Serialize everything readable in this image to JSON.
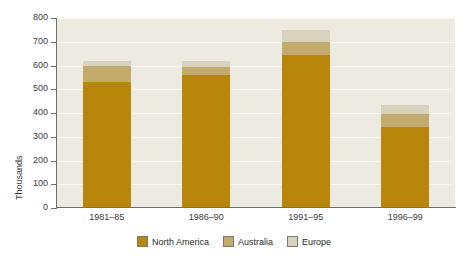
{
  "chart_data": {
    "type": "bar",
    "subtype": "stacked-vertical",
    "title": "",
    "xlabel": "",
    "ylabel": "Thousands",
    "ylim": [
      0,
      800
    ],
    "ytick_step": 100,
    "yticks": [
      0,
      100,
      200,
      300,
      400,
      500,
      600,
      700,
      800
    ],
    "ytick_labels": [
      "0",
      "100",
      "200",
      "300",
      "400",
      "500",
      "600",
      "700",
      "800"
    ],
    "categories": [
      "1981–85",
      "1986–90",
      "1991–95",
      "1996–99"
    ],
    "grid": true,
    "grid_axis": "y",
    "legend_position": "bottom-center",
    "series": [
      {
        "name": "North America",
        "color": "#b8860b",
        "values": [
          530,
          560,
          645,
          340
        ]
      },
      {
        "name": "Australia",
        "color": "#c3ab6e",
        "values": [
          70,
          35,
          55,
          55
        ]
      },
      {
        "name": "Europe",
        "color": "#d9d2bd",
        "values": [
          20,
          25,
          50,
          40
        ]
      }
    ],
    "totals": [
      620,
      620,
      750,
      435
    ],
    "stack_order_bottom_to_top": [
      "North America",
      "Australia",
      "Europe"
    ]
  },
  "colors": {
    "north_america": "#b8860b",
    "australia": "#c3ab6e",
    "europe": "#d9d2bd",
    "plot_background": "#edeae1",
    "gridline": "#f7f6f1",
    "axis": "#6e6e6e",
    "text": "#3b3b3b",
    "page_background": "#ffffff"
  },
  "legend": {
    "items": [
      {
        "label": "North America",
        "color": "#b8860b"
      },
      {
        "label": "Australia",
        "color": "#c3ab6e"
      },
      {
        "label": "Europe",
        "color": "#d9d2bd"
      }
    ]
  },
  "axis_labels": {
    "y_title": "Thousands"
  },
  "caption": ""
}
